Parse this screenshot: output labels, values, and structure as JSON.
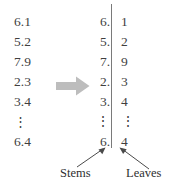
{
  "figure": {
    "type": "stem-and-leaf-plot-illustration",
    "raw_data": {
      "name": "raw-data-values",
      "values": [
        "6.1",
        "5.2",
        "7.9",
        "2.3",
        "3.4",
        "⋮",
        "6.4"
      ]
    },
    "stem_leaf": {
      "name": "stem-and-leaf-plot",
      "rows": [
        {
          "stem": "6.",
          "leaf": "1"
        },
        {
          "stem": "5.",
          "leaf": "2"
        },
        {
          "stem": "7.",
          "leaf": "9"
        },
        {
          "stem": "2.",
          "leaf": "3"
        },
        {
          "stem": "3.",
          "leaf": "4"
        },
        {
          "stem": "⋮",
          "leaf": "⋮"
        },
        {
          "stem": "6.",
          "leaf": "4"
        }
      ]
    },
    "labels": {
      "stems": "Stems",
      "leaves": "Leaves"
    },
    "icons": {
      "transform_arrow": "right-block-arrow",
      "stems_pointer": "arrow-up-right",
      "leaves_pointer": "arrow-up-left"
    },
    "colors": {
      "text": "#3f3f3f",
      "label_text": "#2f2f2f",
      "divider": "#7a7a7a",
      "transform_arrow_fill": "#bdbdbd",
      "annotation_stroke": "#4a4a4a",
      "background": "#ffffff"
    }
  }
}
